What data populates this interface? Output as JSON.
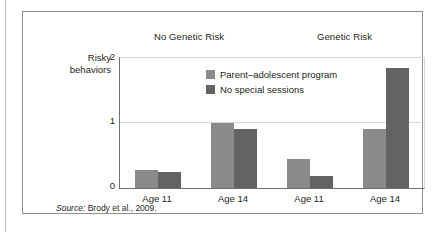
{
  "figure": {
    "y_axis_title_line1": "Risky",
    "y_axis_title_line2": "behaviors",
    "source_lead": "Source:",
    "source_text": " Brody et al., 2009."
  },
  "colors": {
    "series_light": "#8a8a8a",
    "series_dark": "#636363",
    "axis": "#6f6f6f",
    "grid": "#d7d7d7",
    "frame": "#8d8d8d",
    "text": "#231f20"
  },
  "chart_data": {
    "type": "bar",
    "title": "",
    "xlabel": "",
    "ylabel": "Risky behaviors",
    "ylim": [
      0,
      2
    ],
    "yticks": [
      "0",
      "1",
      "2"
    ],
    "grid": true,
    "legend_position": "inside-top-center",
    "groups": [
      {
        "name": "No Genetic Risk",
        "categories": [
          "Age 11",
          "Age 14"
        ]
      },
      {
        "name": "Genetic Risk",
        "categories": [
          "Age 11",
          "Age 14"
        ]
      }
    ],
    "categories": [
      "Age 11",
      "Age 14",
      "Age 11",
      "Age 14"
    ],
    "series": [
      {
        "name": "Parent–adolescent program",
        "color": "#8a8a8a",
        "values": [
          0.27,
          1.0,
          0.45,
          0.91
        ]
      },
      {
        "name": "No special sessions",
        "color": "#636363",
        "values": [
          0.24,
          0.91,
          0.18,
          1.85
        ]
      }
    ]
  }
}
